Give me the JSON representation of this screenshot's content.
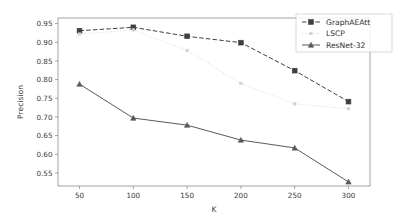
{
  "chart_data": {
    "type": "line",
    "title": "",
    "xlabel": "K",
    "ylabel": "Precision",
    "x": [
      50,
      100,
      150,
      200,
      250,
      300
    ],
    "xticklabels": [
      "50",
      "100",
      "150",
      "200",
      "250",
      "300"
    ],
    "yticks": [
      0.55,
      0.6,
      0.65,
      0.7,
      0.75,
      0.8,
      0.85,
      0.9,
      0.95
    ],
    "yticklabels": [
      "0.55",
      "0.60",
      "0.65",
      "0.70",
      "0.75",
      "0.80",
      "0.85",
      "0.90",
      "0.95"
    ],
    "xlim": [
      30,
      320
    ],
    "ylim": [
      0.515,
      0.965
    ],
    "grid": false,
    "legend_position": "top-right",
    "series": [
      {
        "name": "GraphAEAtt",
        "values": [
          0.931,
          0.94,
          0.916,
          0.899,
          0.824,
          0.741
        ],
        "color": "#3f3f3f",
        "linestyle": "dashed",
        "marker": "square"
      },
      {
        "name": "LSCP",
        "values": [
          0.922,
          0.933,
          0.878,
          0.79,
          0.735,
          0.722
        ],
        "color": "#d2d2d2",
        "linestyle": "dotted",
        "marker": "small-square"
      },
      {
        "name": "ResNet-32",
        "values": [
          0.788,
          0.697,
          0.678,
          0.638,
          0.617,
          0.526
        ],
        "color": "#5a5a5a",
        "linestyle": "solid",
        "marker": "triangle"
      }
    ]
  },
  "axes": {
    "x_axis_title": "K",
    "y_axis_title": "Precision"
  },
  "legend": {
    "items": [
      {
        "label": "GraphAEAtt"
      },
      {
        "label": "LSCP"
      },
      {
        "label": "ResNet-32"
      }
    ]
  }
}
